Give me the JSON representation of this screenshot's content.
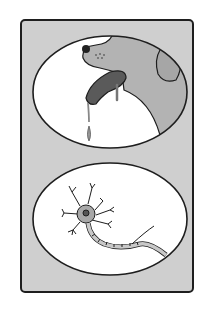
{
  "illustration": {
    "description": "Two-panel illustration: a drooling dog and a neuron",
    "panels": [
      {
        "subject": "dog-drooling"
      },
      {
        "subject": "neuron"
      }
    ],
    "colors": {
      "panel_bg": "#cfcfcf",
      "outline": "#1e1e1e",
      "ellipse_fill": "#ffffff",
      "dog_fill": "#b3b3b3",
      "tongue": "#5a5a5a",
      "neuron_fill": "#a8a8a8"
    }
  }
}
